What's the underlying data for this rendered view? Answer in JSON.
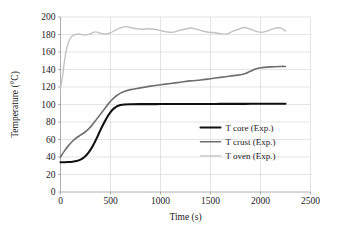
{
  "chart_data": {
    "type": "line",
    "title": "",
    "xlabel": "Time (s)",
    "ylabel": "Temperature (°C)",
    "xlim": [
      0,
      2500
    ],
    "ylim": [
      0,
      200
    ],
    "xticks": [
      0,
      500,
      1000,
      1500,
      2000,
      2500
    ],
    "yticks": [
      0,
      20,
      40,
      60,
      80,
      100,
      120,
      140,
      160,
      180,
      200
    ],
    "grid": true,
    "legend_position": "center-right",
    "series": [
      {
        "name": "T core (Exp.)",
        "color": "#101010",
        "width": 2.1,
        "x": [
          0,
          40,
          80,
          120,
          160,
          200,
          240,
          280,
          320,
          360,
          400,
          440,
          480,
          520,
          560,
          600,
          640,
          700,
          800,
          900,
          1000,
          1100,
          1200,
          1300,
          1400,
          1500,
          1600,
          1700,
          1800,
          1900,
          2000,
          2100,
          2200,
          2250
        ],
        "y": [
          34,
          34,
          34.2,
          34.6,
          35.4,
          37,
          40,
          45,
          52,
          61,
          71,
          80,
          88,
          94,
          97.5,
          99.3,
          100,
          100.3,
          100.4,
          100.4,
          100.5,
          100.5,
          100.5,
          100.6,
          100.6,
          100.6,
          100.7,
          100.7,
          100.7,
          100.8,
          100.8,
          100.8,
          100.9,
          100.9
        ]
      },
      {
        "name": "T crust (Exp.)",
        "color": "#6e6e6e",
        "width": 1.6,
        "x": [
          0,
          40,
          80,
          120,
          160,
          200,
          240,
          280,
          320,
          360,
          400,
          440,
          480,
          520,
          560,
          600,
          650,
          700,
          800,
          900,
          1000,
          1100,
          1200,
          1300,
          1400,
          1500,
          1600,
          1700,
          1800,
          1850,
          1900,
          1950,
          2000,
          2100,
          2200,
          2250
        ],
        "y": [
          40,
          47,
          53,
          58,
          62,
          65,
          68,
          72,
          77,
          83,
          89,
          95,
          101,
          106,
          110,
          113,
          115.5,
          117,
          119,
          121,
          122.5,
          124,
          125.5,
          127,
          128,
          129.5,
          131,
          132.5,
          134,
          135.5,
          138,
          140.5,
          142,
          143,
          143.5,
          143.5
        ]
      },
      {
        "name": "T oven (Exp.)",
        "color": "#c2c2c2",
        "width": 1.4,
        "x": [
          0,
          20,
          40,
          60,
          80,
          100,
          120,
          150,
          180,
          210,
          250,
          300,
          350,
          400,
          450,
          500,
          550,
          600,
          650,
          700,
          760,
          820,
          880,
          940,
          1000,
          1060,
          1120,
          1180,
          1240,
          1300,
          1360,
          1420,
          1480,
          1540,
          1600,
          1660,
          1720,
          1780,
          1840,
          1900,
          1960,
          2020,
          2080,
          2140,
          2200,
          2250
        ],
        "y": [
          118,
          132,
          150,
          163,
          171,
          176,
          178.5,
          180,
          180.5,
          180,
          179.5,
          181,
          183,
          181.5,
          180.5,
          182,
          185,
          187.5,
          189,
          188,
          186.5,
          186,
          186.5,
          186,
          184.5,
          183,
          182.5,
          184.5,
          186,
          187.5,
          186,
          184,
          182.5,
          182,
          181,
          180.5,
          183.5,
          186,
          188,
          186,
          183.5,
          182.5,
          184.5,
          187,
          187.5,
          184
        ]
      }
    ]
  },
  "legend": {
    "items": [
      {
        "label": "T core (Exp.)",
        "color": "#101010"
      },
      {
        "label": "T crust (Exp.)",
        "color": "#6e6e6e"
      },
      {
        "label": "T oven (Exp.)",
        "color": "#c2c2c2"
      }
    ]
  },
  "axes": {
    "x_title": "Time (s)",
    "y_title": "Temperature (°C)"
  }
}
